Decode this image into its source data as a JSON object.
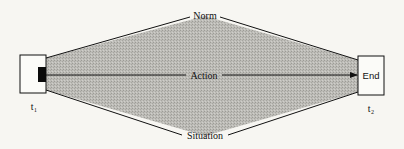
{
  "diagram": {
    "start_box": {
      "label": "",
      "time_label": "t₁"
    },
    "end_box": {
      "label": "End",
      "time_label": "t₂"
    },
    "top_edge_label": "Norm",
    "middle_arrow_label": "Action",
    "bottom_edge_label": "Situation",
    "colors": {
      "background": "#f7f6f2",
      "shaded_region": "#b9b8b3",
      "stroke": "#111111",
      "start_marker": "#0a0a0a"
    }
  }
}
